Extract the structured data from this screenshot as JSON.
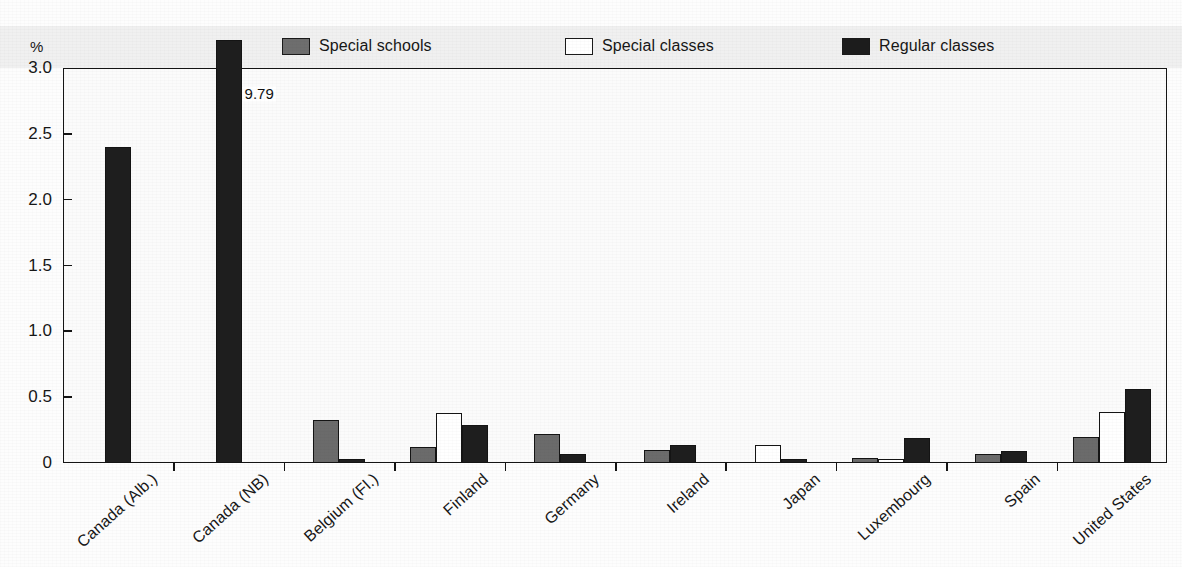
{
  "chart_data": {
    "type": "bar",
    "title": "",
    "xlabel": "",
    "ylabel": "%",
    "ylim": [
      0,
      3.0
    ],
    "ytick_labels": [
      "0",
      "0.5",
      "1.0",
      "1.5",
      "2.0",
      "2.5",
      "3.0"
    ],
    "ytick_values": [
      0,
      0.5,
      1.0,
      1.5,
      2.0,
      2.5,
      3.0
    ],
    "grid": false,
    "legend_position": "top",
    "categories": [
      "Canada (Alb.)",
      "Canada (NB)",
      "Belgium (Fl.)",
      "Finland",
      "Germany",
      "Ireland",
      "Japan",
      "Luxembourg",
      "Spain",
      "United States"
    ],
    "series": [
      {
        "name": "Special schools",
        "color": "#6b6b6b",
        "values": [
          0,
          0,
          0.33,
          0.12,
          0.22,
          0.1,
          0,
          0.04,
          0.07,
          0.2
        ]
      },
      {
        "name": "Special classes",
        "color": "#ffffff",
        "values": [
          0,
          0,
          0,
          0.38,
          0,
          0,
          0.14,
          0.03,
          0,
          0.39
        ]
      },
      {
        "name": "Regular classes",
        "color": "#1e1e1e",
        "values": [
          2.4,
          9.79,
          0.03,
          0.29,
          0.07,
          0.14,
          0.03,
          0.19,
          0.09,
          0.56
        ]
      }
    ],
    "annotations": [
      {
        "text": "9.79",
        "category": "Canada (NB)",
        "series": "Regular classes",
        "note": "value exceeds axis maximum; bar is clipped at top of plot"
      }
    ]
  },
  "legend": {
    "items": [
      {
        "label": "Special schools",
        "swatch": "gray"
      },
      {
        "label": "Special classes",
        "swatch": "white"
      },
      {
        "label": "Regular classes",
        "swatch": "dark"
      }
    ]
  }
}
